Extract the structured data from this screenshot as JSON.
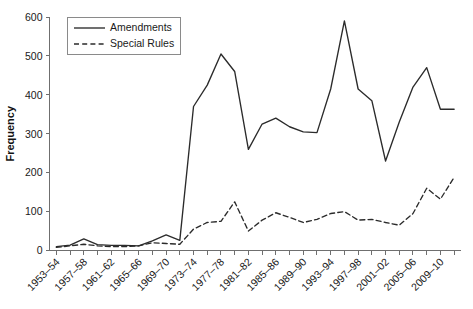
{
  "chart_data": {
    "type": "line",
    "title": "",
    "xlabel": "",
    "ylabel": "Frequency",
    "ylim": [
      0,
      600
    ],
    "yticks": [
      0,
      100,
      200,
      300,
      400,
      500,
      600
    ],
    "grid": false,
    "legend_position": "top-left",
    "categories": [
      "1953–54",
      "1955–56",
      "1957–58",
      "1959–60",
      "1961–62",
      "1963–64",
      "1965–66",
      "1967–68",
      "1969–70",
      "1971–72",
      "1973–74",
      "1975–76",
      "1977–78",
      "1979–80",
      "1981–82",
      "1983–84",
      "1985–86",
      "1987–88",
      "1989–90",
      "1991–92",
      "1993–94",
      "1995–96",
      "1997–98",
      "1999–00",
      "2001–02",
      "2003–04",
      "2005–06",
      "2007–08",
      "2009–10",
      "2011–12"
    ],
    "visible_xtick_labels": [
      "1953–54",
      "1957–58",
      "1961–62",
      "1965–66",
      "1969–70",
      "1973–74",
      "1977–78",
      "1981–82",
      "1985–86",
      "1989–90",
      "1993–94",
      "1997–98",
      "2001–02",
      "2005–06",
      "2009–10"
    ],
    "series": [
      {
        "name": "Amendments",
        "style": "solid",
        "color": "#2b2b2b",
        "values": [
          10,
          14,
          30,
          15,
          13,
          13,
          12,
          25,
          40,
          26,
          370,
          425,
          505,
          460,
          260,
          325,
          340,
          318,
          305,
          303,
          415,
          590,
          415,
          385,
          230,
          330,
          420,
          470,
          363,
          363
        ]
      },
      {
        "name": "Special Rules",
        "style": "dashed",
        "color": "#2b2b2b",
        "values": [
          8,
          12,
          16,
          12,
          10,
          10,
          12,
          20,
          18,
          16,
          55,
          72,
          75,
          125,
          50,
          78,
          97,
          85,
          72,
          80,
          95,
          100,
          78,
          80,
          72,
          65,
          95,
          160,
          132,
          188
        ]
      }
    ]
  },
  "legend": {
    "items": [
      {
        "label": "Amendments",
        "style": "solid"
      },
      {
        "label": "Special Rules",
        "style": "dashed"
      }
    ]
  },
  "axes": {
    "y_title": "Frequency"
  }
}
